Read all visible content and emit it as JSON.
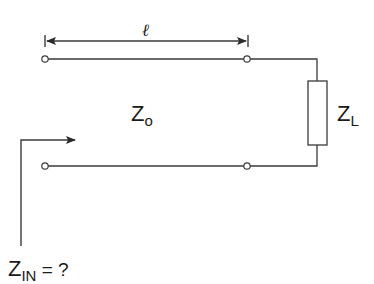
{
  "diagram": {
    "colors": {
      "stroke": "#3a3a3a",
      "text": "#1a1a1a",
      "background": "#ffffff"
    },
    "length_label": "ℓ",
    "line_impedance": {
      "main": "Z",
      "sub": "o"
    },
    "load_impedance": {
      "main": "Z",
      "sub": "L"
    },
    "input_impedance": {
      "main": "Z",
      "sub": "IN",
      "suffix": " = ?"
    },
    "components": [
      {
        "type": "terminal",
        "name": "input-terminal-top",
        "x": 45,
        "y": 59
      },
      {
        "type": "terminal",
        "name": "output-terminal-top",
        "x": 247,
        "y": 59
      },
      {
        "type": "terminal",
        "name": "input-terminal-bottom",
        "x": 45,
        "y": 166
      },
      {
        "type": "terminal",
        "name": "output-terminal-bottom",
        "x": 247,
        "y": 166
      },
      {
        "type": "resistor",
        "name": "load-resistor",
        "x": 308,
        "y": 81,
        "w": 19,
        "h": 64
      }
    ]
  }
}
